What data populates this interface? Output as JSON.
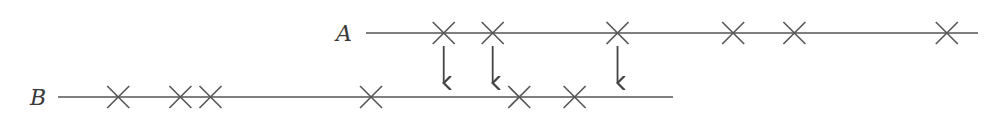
{
  "diagram": {
    "type": "chromosome-crossover-transfer",
    "lines": [
      {
        "id": "A",
        "label": "A",
        "marks": [
          0.127,
          0.207,
          0.411,
          0.6,
          0.7,
          0.949
        ]
      },
      {
        "id": "B",
        "label": "B",
        "marks": [
          0.098,
          0.199,
          0.248,
          0.509,
          0.75,
          0.84
        ]
      }
    ],
    "arrows": [
      {
        "from_line": "A",
        "mark_index": 0
      },
      {
        "from_line": "A",
        "mark_index": 1
      },
      {
        "from_line": "A",
        "mark_index": 2
      }
    ],
    "colors": {
      "stroke": "#555555",
      "label": "#3a3a3a"
    }
  }
}
